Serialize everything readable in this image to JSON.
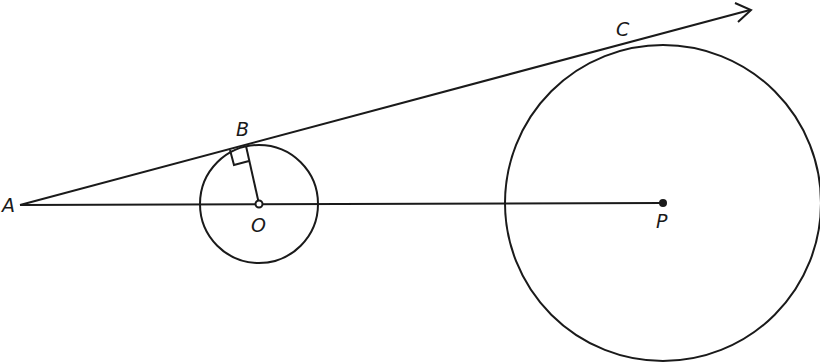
{
  "diagram": {
    "points": {
      "A": {
        "label": "A"
      },
      "B": {
        "label": "B"
      },
      "C": {
        "label": "C"
      },
      "O": {
        "label": "O"
      },
      "P": {
        "label": "P"
      }
    },
    "annotations": [
      "right-angle mark at B between OB and tangent line"
    ],
    "colors": {
      "stroke": "#1a1a1a",
      "background": "#ffffff"
    }
  }
}
